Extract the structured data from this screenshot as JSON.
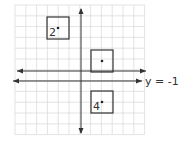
{
  "diagram": {
    "type": "coordinate-grid-reflection",
    "grid": {
      "x0": 15,
      "y0": 5,
      "cell": 10.8,
      "cols": 12,
      "rows": 12,
      "color": "#dcdcdc"
    },
    "axes": {
      "x_axis_y": 71,
      "y_axis_x": 81,
      "color": "#333333"
    },
    "line_of_reflection": {
      "label": "y = -1",
      "y": 81
    },
    "squares": [
      {
        "id": "square-2",
        "label": "2",
        "x": 47,
        "y": 17,
        "size": 22,
        "dot": [
          58,
          28
        ]
      },
      {
        "id": "square-1",
        "label": "",
        "x": 91,
        "y": 50,
        "size": 22,
        "dot": [
          102,
          61
        ]
      },
      {
        "id": "square-4",
        "label": "4",
        "x": 91,
        "y": 91,
        "size": 22,
        "dot": [
          102,
          102
        ]
      }
    ]
  }
}
